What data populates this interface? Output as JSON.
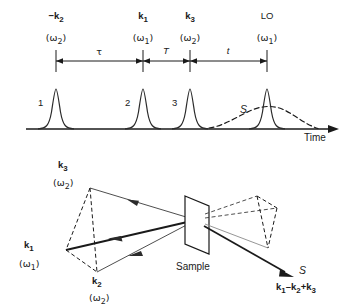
{
  "figure": {
    "kind": "pulse-sequence-and-phase-matching-diagram",
    "top_panel": {
      "axis_label": "Time",
      "pulses": [
        {
          "number": "1",
          "wavevector": "−k",
          "wavevector_sub": "2",
          "frequency": "(ω",
          "frequency_sub": "2",
          "frequency_close": ")",
          "x": 56
        },
        {
          "number": "2",
          "wavevector": "k",
          "wavevector_sub": "1",
          "frequency": "(ω",
          "frequency_sub": "1",
          "frequency_close": ")",
          "x": 143
        },
        {
          "number": "3",
          "wavevector": "k",
          "wavevector_sub": "3",
          "frequency": "(ω",
          "frequency_sub": "2",
          "frequency_close": ")",
          "x": 190
        },
        {
          "number": "",
          "wavevector": "LO",
          "wavevector_sub": "",
          "frequency": "(ω",
          "frequency_sub": "1",
          "frequency_close": ")",
          "x": 267
        }
      ],
      "intervals": [
        {
          "label": "τ",
          "from_x": 56,
          "to_x": 143,
          "italic": false
        },
        {
          "label": "T",
          "from_x": 143,
          "to_x": 190,
          "italic": true
        },
        {
          "label": "t",
          "from_x": 190,
          "to_x": 267,
          "italic": true
        }
      ],
      "signal": {
        "label": "S",
        "italic": true,
        "style": "dashed",
        "peak_x": 275
      }
    },
    "bottom_panel": {
      "sample_label": "Sample",
      "input_beams": [
        {
          "wavevector": "k",
          "wavevector_sub": "3",
          "frequency": "(ω",
          "frequency_sub": "2",
          "frequency_close": ")"
        },
        {
          "wavevector": "k",
          "wavevector_sub": "1",
          "frequency": "(ω",
          "frequency_sub": "1",
          "frequency_close": ")"
        },
        {
          "wavevector": "k",
          "wavevector_sub": "2",
          "frequency": "(ω",
          "frequency_sub": "2",
          "frequency_close": ")"
        }
      ],
      "output": {
        "signal_label": "S",
        "phase_matching": "k₁ − k₂ + k₃",
        "pm_parts": [
          "k",
          "1",
          "–",
          "k",
          "2",
          "+",
          "k",
          "3"
        ]
      }
    },
    "colors": {
      "ink": "#1a1a1a",
      "curve": "#2b2b2b"
    }
  }
}
